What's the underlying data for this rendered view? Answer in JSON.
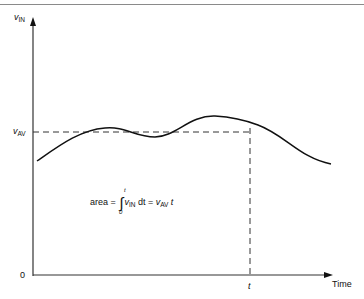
{
  "diagram": {
    "y_axis": {
      "label_main": "v",
      "label_sub": "IN"
    },
    "x_axis": {
      "label": "Time",
      "origin_label": "0",
      "tick_label": "t"
    },
    "average_line": {
      "label_main": "v",
      "label_sub": "AV"
    },
    "formula": {
      "prefix": "area = ",
      "integral_sign": "∫",
      "upper_limit": "t",
      "lower_limit": "0",
      "integrand_main": "v",
      "integrand_sub": "IN",
      "differential": " dt = ",
      "result_main": "v",
      "result_sub": "AV",
      "result_suffix": " t"
    },
    "colors": {
      "line": "#111111",
      "dashed": "#333333",
      "border": "#8a8a8a"
    }
  }
}
